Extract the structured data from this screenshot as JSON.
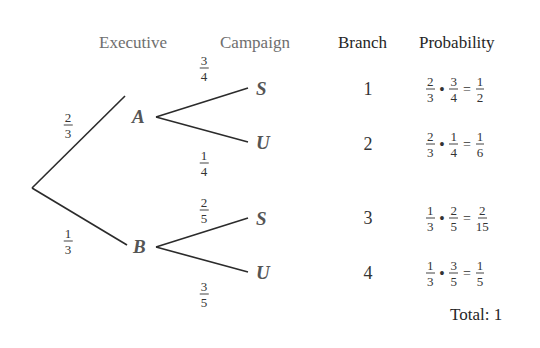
{
  "headers": {
    "executive": "Executive",
    "campaign": "Campaign",
    "branch": "Branch",
    "probability": "Probability"
  },
  "tree": {
    "nodes": {
      "A": "A",
      "B": "B"
    },
    "root_edges": [
      {
        "to": "A",
        "num": "2",
        "den": "3"
      },
      {
        "to": "B",
        "num": "1",
        "den": "3"
      }
    ],
    "leaves": [
      {
        "parent": "A",
        "label": "S",
        "num": "3",
        "den": "4"
      },
      {
        "parent": "A",
        "label": "U",
        "num": "1",
        "den": "4"
      },
      {
        "parent": "B",
        "label": "S",
        "num": "2",
        "den": "5"
      },
      {
        "parent": "B",
        "label": "U",
        "num": "3",
        "den": "5"
      }
    ]
  },
  "rows": [
    {
      "branch": "1",
      "a_num": "2",
      "a_den": "3",
      "op": "•",
      "b_num": "3",
      "b_den": "4",
      "eq": "=",
      "r_num": "1",
      "r_den": "2"
    },
    {
      "branch": "2",
      "a_num": "2",
      "a_den": "3",
      "op": "•",
      "b_num": "1",
      "b_den": "4",
      "eq": "=",
      "r_num": "1",
      "r_den": "6"
    },
    {
      "branch": "3",
      "a_num": "1",
      "a_den": "3",
      "op": "•",
      "b_num": "2",
      "b_den": "5",
      "eq": "=",
      "r_num": "2",
      "r_den": "15"
    },
    {
      "branch": "4",
      "a_num": "1",
      "a_den": "3",
      "op": "•",
      "b_num": "3",
      "b_den": "5",
      "eq": "=",
      "r_num": "1",
      "r_den": "5"
    }
  ],
  "total": "Total: 1",
  "colors": {
    "line": "#2b2b2b",
    "header_gray": "#6e6e6e",
    "node_gray": "#555555"
  }
}
